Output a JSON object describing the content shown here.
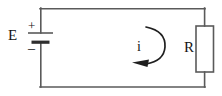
{
  "figure": {
    "background_color": "#ffffff",
    "line_color": "#5a5a5a",
    "text_color": "#141414"
  },
  "labels": {
    "source": "E",
    "resistor": "R",
    "current": "i",
    "terminal_positive": "+",
    "terminal_negative": "–"
  },
  "components": [
    {
      "name": "voltage-source",
      "symbol": "battery",
      "label": "E",
      "position": "left-branch",
      "terminals": {
        "top": "+",
        "bottom": "–"
      }
    },
    {
      "name": "resistor",
      "symbol": "rectangle-box",
      "label": "R",
      "position": "right-branch"
    },
    {
      "name": "current-arrow",
      "symbol": "curved-arrow-counterclockwise",
      "label": "i",
      "position": "center-loop",
      "direction": "counterclockwise"
    }
  ],
  "wires": {
    "left_x": 40,
    "right_x": 205,
    "top_y": 8,
    "bottom_y": 87,
    "stroke_width": 1.6
  },
  "geometry": {
    "battery_long_plate": {
      "x1": 28,
      "x2": 53,
      "y": 33
    },
    "battery_short_plate": {
      "x1": 32,
      "x2": 49,
      "y": 42,
      "thickness": 3
    },
    "resistor_box": {
      "x": 196,
      "y": 26,
      "width": 18,
      "height": 46
    },
    "current_arc": {
      "cx": 150,
      "cy": 45,
      "r": 18
    }
  }
}
